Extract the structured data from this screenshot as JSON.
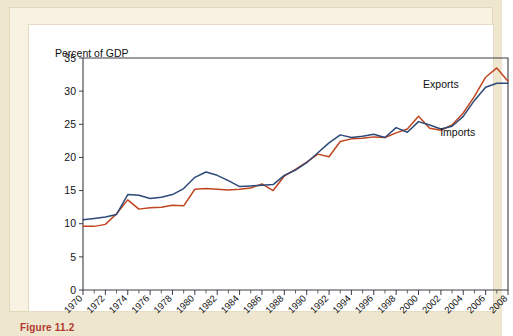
{
  "figure": {
    "caption": "Figure 11.2"
  },
  "chart_data": {
    "type": "line",
    "title": "",
    "axis_note": "Percent of GDP",
    "xlabel": "",
    "ylabel": "Percent of GDP",
    "xlim": [
      1970,
      2008
    ],
    "ylim": [
      0,
      35
    ],
    "ytick_labels": [
      "0",
      "5",
      "10",
      "15",
      "20",
      "25",
      "30",
      "35"
    ],
    "ytick_values": [
      0,
      5,
      10,
      15,
      20,
      25,
      30,
      35
    ],
    "grid": false,
    "legend_position": "inline-annotations",
    "x": [
      1970,
      1971,
      1972,
      1973,
      1974,
      1975,
      1976,
      1977,
      1978,
      1979,
      1980,
      1981,
      1982,
      1983,
      1984,
      1985,
      1986,
      1987,
      1988,
      1989,
      1990,
      1991,
      1992,
      1993,
      1994,
      1995,
      1996,
      1997,
      1998,
      1999,
      2000,
      2001,
      2002,
      2003,
      2004,
      2005,
      2006,
      2007,
      2008
    ],
    "xtick_labels": [
      "1970",
      "1972",
      "1974",
      "1976",
      "1978",
      "1980",
      "1982",
      "1984",
      "1986",
      "1988",
      "1990",
      "1992",
      "1994",
      "1996",
      "1998",
      "2000",
      "2002",
      "2004",
      "2006",
      "2008"
    ],
    "series": [
      {
        "name": "Exports",
        "color": "#c0461f",
        "values": [
          9.6,
          9.6,
          9.9,
          11.5,
          13.6,
          12.2,
          12.4,
          12.5,
          12.8,
          12.7,
          15.2,
          15.3,
          15.2,
          15.1,
          15.2,
          15.4,
          16.0,
          15.0,
          17.2,
          18.2,
          19.3,
          20.5,
          20.1,
          22.4,
          22.8,
          22.9,
          23.1,
          23.0,
          23.7,
          24.3,
          26.2,
          24.4,
          24.1,
          24.9,
          26.7,
          29.2,
          32.1,
          33.5,
          31.5
        ]
      },
      {
        "name": "Imports",
        "color": "#2d4a78",
        "values": [
          10.6,
          10.8,
          11.0,
          11.4,
          14.4,
          14.3,
          13.8,
          14.0,
          14.4,
          15.3,
          17.0,
          17.8,
          17.3,
          16.5,
          15.6,
          15.7,
          15.8,
          15.9,
          17.3,
          18.1,
          19.2,
          20.7,
          22.2,
          23.4,
          23.0,
          23.2,
          23.5,
          23.0,
          24.5,
          23.8,
          25.4,
          24.9,
          24.3,
          24.7,
          26.2,
          28.6,
          30.6,
          31.2,
          31.2
        ]
      }
    ],
    "annotations": [
      {
        "text": "Exports",
        "x": 2002,
        "y": 30.5
      },
      {
        "text": "Imports",
        "x": 2003.5,
        "y": 23.2
      }
    ]
  }
}
